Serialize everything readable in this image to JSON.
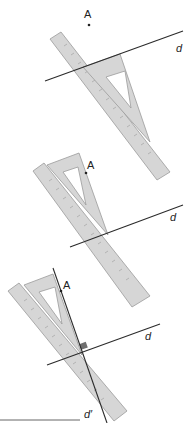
{
  "colors": {
    "line": "#2b2b2b",
    "tool_fill": "#d6d6d6",
    "tool_stroke": "#9a9a9a",
    "right_angle_mark": "#707070",
    "background": "#ffffff"
  },
  "steps": [
    {
      "step": 1,
      "point_label": "A",
      "line_label": "d",
      "description": "Set-square edge placed along line d, ruler placed against set-square"
    },
    {
      "step": 2,
      "point_label": "A",
      "line_label": "d",
      "description": "Set-square slid along ruler until its edge reaches A"
    },
    {
      "step": 3,
      "point_label": "A",
      "line_label": "d",
      "perpendicular_label": "d′",
      "description": "Line d′ drawn through A perpendicular to d"
    }
  ]
}
